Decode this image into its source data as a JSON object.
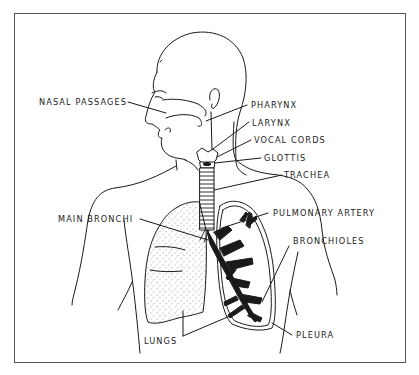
{
  "diagram": {
    "type": "anatomical-illustration",
    "colors": {
      "ink": "#1a1a1a",
      "frame": "#555555",
      "background": "#ffffff"
    },
    "labels": [
      {
        "id": "nasal-passages",
        "text": "NASAL PASSAGES",
        "side": "left"
      },
      {
        "id": "pharynx",
        "text": "PHARYNX",
        "side": "right"
      },
      {
        "id": "larynx",
        "text": "LARYNX",
        "side": "right"
      },
      {
        "id": "vocal-cords",
        "text": "VOCAL CORDS",
        "side": "right"
      },
      {
        "id": "glottis",
        "text": "GLOTTIS",
        "side": "right"
      },
      {
        "id": "trachea",
        "text": "TRACHEA",
        "side": "right"
      },
      {
        "id": "main-bronchi",
        "text": "MAIN BRONCHI",
        "side": "left"
      },
      {
        "id": "pulmonary-artery",
        "text": "PULMONARY ARTERY",
        "side": "right"
      },
      {
        "id": "bronchioles",
        "text": "BRONCHIOLES",
        "side": "right"
      },
      {
        "id": "lungs",
        "text": "LUNGS",
        "side": "bottom"
      },
      {
        "id": "pleura",
        "text": "PLEURA",
        "side": "right"
      }
    ]
  }
}
